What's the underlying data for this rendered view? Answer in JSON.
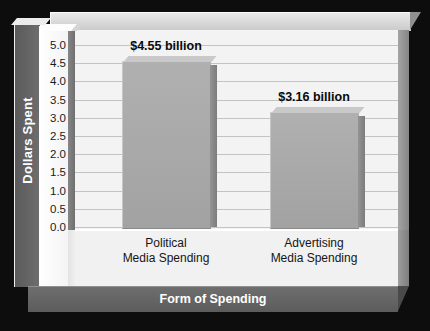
{
  "chart_data": {
    "type": "bar",
    "title": "",
    "xlabel": "Form of Spending",
    "ylabel": "Dollars Spent",
    "categories": [
      "Political\nMedia Spending",
      "Advertising\nMedia Spending"
    ],
    "category_lines": [
      [
        "Political",
        "Media Spending"
      ],
      [
        "Advertising",
        "Media Spending"
      ]
    ],
    "values": [
      4.55,
      3.16
    ],
    "value_labels": [
      "$4.55 billion",
      "$3.16 billion"
    ],
    "ylim": [
      0.0,
      5.0
    ],
    "ytick_values": [
      5.0,
      4.5,
      4.0,
      3.5,
      3.0,
      2.5,
      2.0,
      1.5,
      1.0,
      0.5,
      0.0
    ],
    "ytick_labels": [
      "5.0",
      "4.5",
      "4.0",
      "3.5",
      "3.0",
      "2.5",
      "2.0",
      "1.5",
      "1.0",
      "0.5",
      "0.0"
    ],
    "grid": true,
    "legend": false,
    "style": "3d-bar",
    "colors": {
      "background": "#0d0d0d",
      "plot_wall": "#f3f3f3",
      "gridline": "#c3c3c3",
      "bar_fill": "#a8a8a8",
      "bar_side": "#868686",
      "axis_panel": "#636363",
      "axis_title_text": "#ffffff",
      "tick_text": "#1b1b1b",
      "value_label_text": "#0a0a0a"
    }
  }
}
